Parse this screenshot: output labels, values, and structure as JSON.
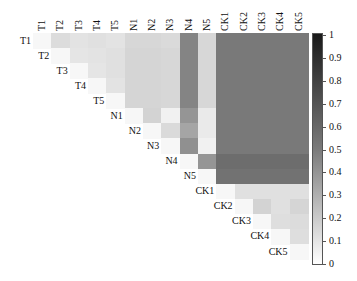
{
  "chart_data": {
    "type": "heatmap",
    "title": "",
    "xlabel": "",
    "ylabel": "",
    "labels": [
      "T1",
      "T2",
      "T3",
      "T4",
      "T5",
      "N1",
      "N2",
      "N3",
      "N4",
      "N5",
      "CK1",
      "CK2",
      "CK3",
      "CK4",
      "CK5"
    ],
    "triangle": "upper",
    "matrix": [
      [
        0.02,
        0.14,
        0.11,
        0.12,
        0.11,
        0.16,
        0.16,
        0.15,
        0.52,
        0.16,
        0.57,
        0.57,
        0.57,
        0.57,
        0.57
      ],
      [
        null,
        0.02,
        0.1,
        0.11,
        0.12,
        0.17,
        0.17,
        0.16,
        0.52,
        0.16,
        0.57,
        0.57,
        0.57,
        0.57,
        0.57
      ],
      [
        null,
        null,
        0.02,
        0.1,
        0.12,
        0.17,
        0.17,
        0.16,
        0.52,
        0.16,
        0.57,
        0.57,
        0.57,
        0.57,
        0.57
      ],
      [
        null,
        null,
        null,
        0.02,
        0.11,
        0.17,
        0.17,
        0.16,
        0.52,
        0.16,
        0.57,
        0.57,
        0.57,
        0.57,
        0.57
      ],
      [
        null,
        null,
        null,
        null,
        0.02,
        0.17,
        0.17,
        0.16,
        0.52,
        0.16,
        0.57,
        0.57,
        0.57,
        0.57,
        0.57
      ],
      [
        null,
        null,
        null,
        null,
        null,
        0.02,
        0.18,
        0.05,
        0.45,
        0.08,
        0.57,
        0.57,
        0.57,
        0.57,
        0.57
      ],
      [
        null,
        null,
        null,
        null,
        null,
        null,
        0.02,
        0.15,
        0.38,
        0.08,
        0.57,
        0.57,
        0.57,
        0.57,
        0.57
      ],
      [
        null,
        null,
        null,
        null,
        null,
        null,
        null,
        0.02,
        0.47,
        0.05,
        0.57,
        0.57,
        0.57,
        0.57,
        0.57
      ],
      [
        null,
        null,
        null,
        null,
        null,
        null,
        null,
        null,
        0.02,
        0.45,
        0.62,
        0.62,
        0.62,
        0.62,
        0.62
      ],
      [
        null,
        null,
        null,
        null,
        null,
        null,
        null,
        null,
        null,
        0.02,
        0.6,
        0.6,
        0.6,
        0.6,
        0.6
      ],
      [
        null,
        null,
        null,
        null,
        null,
        null,
        null,
        null,
        null,
        null,
        0.02,
        0.12,
        0.12,
        0.12,
        0.12
      ],
      [
        null,
        null,
        null,
        null,
        null,
        null,
        null,
        null,
        null,
        null,
        null,
        0.02,
        0.18,
        0.12,
        0.17
      ],
      [
        null,
        null,
        null,
        null,
        null,
        null,
        null,
        null,
        null,
        null,
        null,
        null,
        0.02,
        0.13,
        0.14
      ],
      [
        null,
        null,
        null,
        null,
        null,
        null,
        null,
        null,
        null,
        null,
        null,
        null,
        null,
        0.02,
        0.13
      ],
      [
        null,
        null,
        null,
        null,
        null,
        null,
        null,
        null,
        null,
        null,
        null,
        null,
        null,
        null,
        0.02
      ]
    ],
    "colorbar": {
      "range": [
        0,
        1
      ],
      "ticks": [
        "0",
        "0.1",
        "0.2",
        "0.3",
        "0.4",
        "0.5",
        "0.6",
        "0.7",
        "0.8",
        "0.9",
        "1"
      ],
      "colormap": "gray_r",
      "position": "right"
    },
    "grid": false,
    "legend": "colorbar-right"
  }
}
